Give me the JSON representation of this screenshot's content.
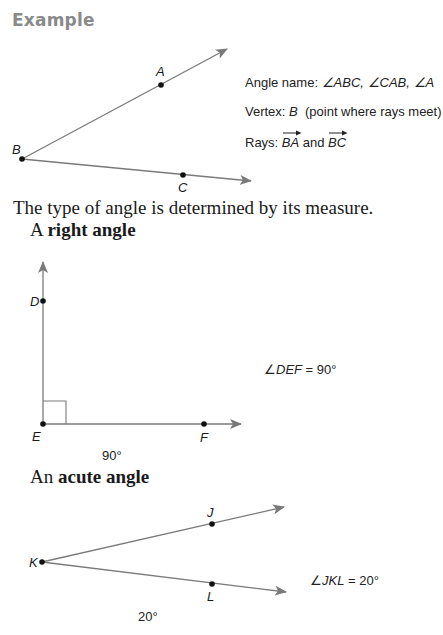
{
  "heading": "Example",
  "example": {
    "points": {
      "A": "A",
      "B": "B",
      "C": "C"
    },
    "info": {
      "angle_name_label": "Angle name: ",
      "angle_names": [
        "∠ABC",
        "∠CAB",
        "∠A"
      ],
      "angle_names_text": "∠ABC, ∠CAB, ∠A",
      "vertex_label": "Vertex: ",
      "vertex_value": "B",
      "vertex_note": "(point where rays meet)",
      "rays_label": "Rays: ",
      "ray_1": "BA",
      "rays_and": " and ",
      "ray_2": "BC"
    }
  },
  "intro_text": "The type of angle is determined by its measure.",
  "right_angle": {
    "title_prefix": "A ",
    "title_bold": "right angle",
    "points": {
      "D": "D",
      "E": "E",
      "F": "F"
    },
    "measure_label": "90°",
    "equation_angle": "∠",
    "equation_name": "DEF",
    "equation_value": " = 90°"
  },
  "acute_angle": {
    "title_prefix": "An ",
    "title_bold": "acute angle",
    "points": {
      "J": "J",
      "K": "K",
      "L": "L"
    },
    "measure_label": "20°",
    "equation_angle": "∠",
    "equation_name": "JKL",
    "equation_value": " = 20°"
  },
  "colors": {
    "heading": "#8a8a8a",
    "ray": "#7a7a7a",
    "point": "#111111",
    "text": "#1a1a1a"
  }
}
